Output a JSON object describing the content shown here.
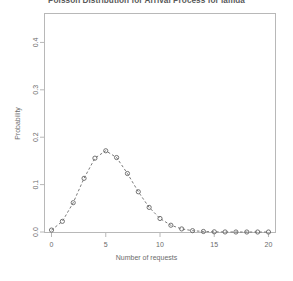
{
  "chart_data": {
    "type": "scatter",
    "title": "Poisson Distribution for Arrival Process for lamda",
    "xlabel": "Number of requests",
    "ylabel": "Probability",
    "x": [
      0,
      1,
      2,
      3,
      4,
      5,
      6,
      7,
      8,
      9,
      10,
      11,
      12,
      13,
      14,
      15,
      16,
      17,
      18,
      19,
      20
    ],
    "values": [
      0.0041,
      0.0225,
      0.0618,
      0.1133,
      0.1558,
      0.1714,
      0.1571,
      0.1234,
      0.0849,
      0.0519,
      0.0285,
      0.0143,
      0.0065,
      0.0028,
      0.0011,
      0.0004,
      0.0001,
      0.0,
      0.0,
      0.0,
      0.0
    ],
    "series_name": "Poisson PMF",
    "lambda": 5.5,
    "xlim": [
      -0.6,
      20.6
    ],
    "ylim": [
      0.0,
      0.46
    ],
    "xticks": [
      0,
      5,
      10,
      15,
      20
    ],
    "xtick_labels": [
      "0",
      "5",
      "10",
      "15",
      "20"
    ],
    "yticks": [
      0.0,
      0.1,
      0.2,
      0.3,
      0.4
    ],
    "ytick_labels": [
      "0.0",
      "0.1",
      "0.2",
      "0.3",
      "0.4"
    ],
    "grid": false,
    "legend": null,
    "marker": "open-circle",
    "line_style": "dashed",
    "series_color": "#6b6b6b",
    "frame_color": "#b8b8b8",
    "background": "#ffffff"
  }
}
